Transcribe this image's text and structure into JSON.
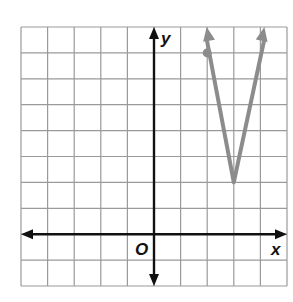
{
  "chart_data": {
    "type": "line",
    "title": "",
    "xlabel": "x",
    "ylabel": "y",
    "origin_label": "O",
    "xlim": [
      -5,
      5
    ],
    "ylim": [
      -2,
      8
    ],
    "grid": true,
    "grid_step": 1,
    "tick_labels_shown": false,
    "series": [
      {
        "name": "absolute value function",
        "equation": "y = 5|x - 3| + 2",
        "vertex": [
          3,
          2
        ],
        "points": [
          [
            2.0,
            7
          ],
          [
            3,
            2
          ],
          [
            4.0,
            7
          ]
        ],
        "left_arrow_end": [
          1.98,
          8
        ],
        "right_arrow_end": [
          4.15,
          8
        ],
        "marked_point": [
          2,
          7
        ],
        "color": "#8c8c8c"
      }
    ]
  },
  "labels": {
    "x_axis": "x",
    "y_axis": "y",
    "origin": "O"
  },
  "colors": {
    "grid": "#9a9a9a",
    "axes": "#111111",
    "curve": "#8c8c8c"
  }
}
